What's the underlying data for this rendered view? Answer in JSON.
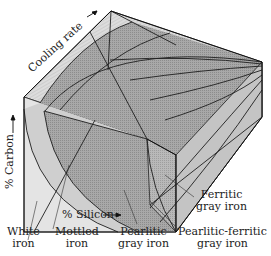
{
  "figure": {
    "type": "3D iron phase diagram block",
    "axes": {
      "cooling_rate": "Cooling rate",
      "carbon": "% Carbon",
      "silicon": "% Silicon"
    },
    "regions": [
      {
        "id": "white",
        "label_line1": "White",
        "label_line2": "iron"
      },
      {
        "id": "mottled",
        "label_line1": "Mottled",
        "label_line2": "iron"
      },
      {
        "id": "pearlitic",
        "label_line1": "Pearlitic",
        "label_line2": "gray iron"
      },
      {
        "id": "pearlitic-ferritic",
        "label_line1": "Pearlitic-ferritic",
        "label_line2": "gray iron"
      },
      {
        "id": "ferritic",
        "label_line1": "Ferritic",
        "label_line2": "gray iron"
      }
    ],
    "colors": {
      "white_region": "#e4e4e4",
      "mottled_band": "#cfcfcf",
      "pearlitic": "#a9a9a9",
      "pearlitic_ferritic": "#9a9a9a",
      "ferritic": "#bdbdbd",
      "edge": "#1e1e1e"
    }
  }
}
